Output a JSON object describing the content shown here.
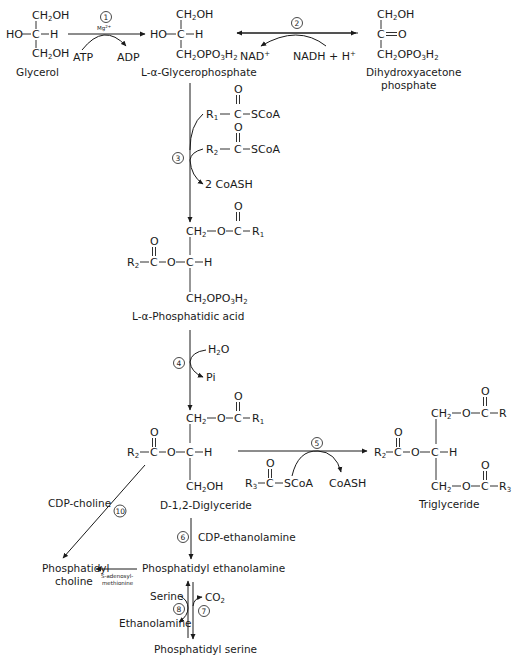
{
  "diagram": {
    "compounds": {
      "glycerol": {
        "name": "Glycerol",
        "top": "CH2OH",
        "mid_left": "HO",
        "mid_c": "C",
        "mid_right": "H",
        "bottom": "CH2OH"
      },
      "glycerophosphate": {
        "name": "L-α-Glycerophosphate",
        "top": "CH2OH",
        "mid_left": "HO",
        "mid_c": "C",
        "mid_right": "H",
        "bottom": "CH2OPO3H2"
      },
      "dhap": {
        "name_line1": "Dihydroxyacetone",
        "name_line2": "phosphate",
        "top": "CH2OH",
        "mid": "C=O",
        "bottom": "CH2OPO3H2"
      },
      "phosphatidic_acid": {
        "name": "L-α-Phosphatidic acid",
        "top": "CH2—O—C—R1",
        "mid": "R2—C—O—C—H",
        "bottom": "CH2OPO3H2"
      },
      "diglyceride": {
        "name": "D-1,2-Diglyceride",
        "top": "CH2—O—C—R1",
        "mid": "R2—C—O—C—H",
        "bottom": "CH2OH"
      },
      "triglyceride": {
        "name": "Triglyceride",
        "top": "CH2—O—C—R",
        "mid": "R2—C—O—C—H",
        "bottom": "CH2—O—C—R3"
      },
      "phosphatidyl_ethanolamine": {
        "name": "Phosphatidyl ethanolamine"
      },
      "phosphatidyl_choline": {
        "name_line1": "Phosphatidyl",
        "name_line2": "choline"
      },
      "phosphatidyl_serine": {
        "name": "Phosphatidyl serine"
      }
    },
    "reactions": [
      {
        "step": "1",
        "cofactor": "Mg2+",
        "in": "ATP",
        "out": "ADP"
      },
      {
        "step": "2",
        "in": "NAD+",
        "out": "NADH + H+"
      },
      {
        "step": "3",
        "in1": "R1—C—SCoA",
        "in2": "R2—C—SCoA",
        "out": "2 CoASH"
      },
      {
        "step": "4",
        "in": "H2O",
        "out": "Pi"
      },
      {
        "step": "5",
        "in": "R3—C—SCoA",
        "out": "CoASH"
      },
      {
        "step": "6",
        "reagent": "CDP-ethanolamine"
      },
      {
        "step": "7",
        "out": "CO2"
      },
      {
        "step": "8",
        "in": "Serine",
        "out": "Ethanolamine"
      },
      {
        "step": "10",
        "reagent": "CDP-choline"
      },
      {
        "step": "",
        "reagent_line1": "S-adenosyl-",
        "reagent_line2": "methionine"
      }
    ]
  }
}
